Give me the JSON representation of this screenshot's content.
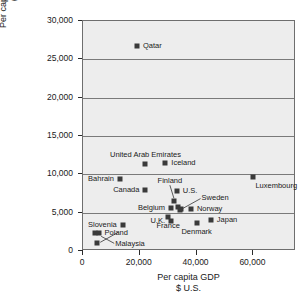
{
  "chart_data": {
    "type": "scatter",
    "title": "",
    "xlabel": "Per capita GDP\n$ U.S.",
    "ylabel": "Per capita energy consumption\n(kg oil equivalent)",
    "xlim": [
      0,
      75000
    ],
    "ylim": [
      0,
      30000
    ],
    "grid": true,
    "legend": "none",
    "xticks": [
      "0",
      "20,000",
      "40,000",
      "60,000"
    ],
    "xtick_values": [
      0,
      20000,
      40000,
      60000
    ],
    "yticks": [
      "0",
      "5,000",
      "10,000",
      "15,000",
      "20,000",
      "25,000",
      "30,000"
    ],
    "ytick_values": [
      0,
      5000,
      10000,
      15000,
      20000,
      25000,
      30000
    ],
    "points": [
      {
        "name": "Qatar",
        "x": 19000,
        "y": 26700,
        "label_pos": "right"
      },
      {
        "name": "Iceland",
        "x": 29000,
        "y": 11500,
        "label_pos": "right"
      },
      {
        "name": "United Arab Emirates",
        "x": 22000,
        "y": 11300,
        "label_pos": "above"
      },
      {
        "name": "Luxembourg",
        "x": 60000,
        "y": 9700,
        "label_pos": "below-right"
      },
      {
        "name": "Bahrain",
        "x": 13000,
        "y": 9400,
        "label_pos": "left"
      },
      {
        "name": "Canada",
        "x": 22000,
        "y": 8000,
        "label_pos": "left"
      },
      {
        "name": "U.S.",
        "x": 33000,
        "y": 7800,
        "label_pos": "right"
      },
      {
        "name": "Finland",
        "x": 32000,
        "y": 6500,
        "label_pos": "leader-above"
      },
      {
        "name": "Belgium",
        "x": 31000,
        "y": 5600,
        "label_pos": "left"
      },
      {
        "name": "Norway",
        "x": 38000,
        "y": 5500,
        "label_pos": "right"
      },
      {
        "name": "Sweden",
        "x": 34000,
        "y": 5400,
        "label_pos": "leader-right"
      },
      {
        "name": "France",
        "x": 30000,
        "y": 4400,
        "label_pos": "below"
      },
      {
        "name": "Japan",
        "x": 45000,
        "y": 4000,
        "label_pos": "right"
      },
      {
        "name": "U.K.",
        "x": 31000,
        "y": 3900,
        "label_pos": "left"
      },
      {
        "name": "Denmark",
        "x": 40000,
        "y": 3700,
        "label_pos": "below"
      },
      {
        "name": "Slovenia",
        "x": 14000,
        "y": 3400,
        "label_pos": "left"
      },
      {
        "name": "Poland",
        "x": 5500,
        "y": 2400,
        "label_pos": "right"
      },
      {
        "name": "Malaysia",
        "x": 5000,
        "y": 1000,
        "label_pos": "leader-right"
      }
    ],
    "extra_markers": [
      {
        "x": 4200,
        "y": 2400
      },
      {
        "x": 33500,
        "y": 5700
      },
      {
        "x": 34500,
        "y": 5450
      }
    ],
    "colors": {
      "marker": "#3a3a3a",
      "plot_background": "#ededed",
      "gridline": "#7a7a7a",
      "frame": "#6e6e6e",
      "text": "#1a1a1a"
    }
  }
}
